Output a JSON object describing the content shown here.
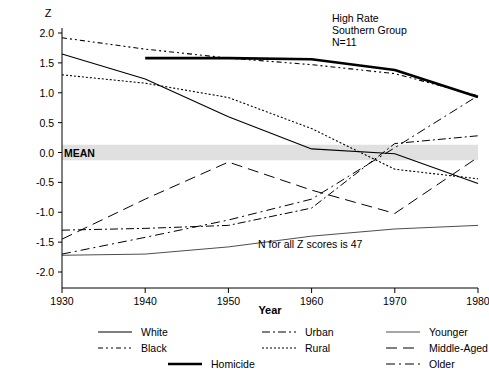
{
  "chart_data": {
    "type": "line",
    "title": "",
    "xlabel": "Year",
    "ylabel": "Z",
    "xlim": [
      1930,
      1980
    ],
    "ylim": [
      -2.0,
      2.0
    ],
    "grid": false,
    "legend_position": "bottom",
    "x": [
      1930,
      1940,
      1950,
      1960,
      1970,
      1980
    ],
    "xticklabels": [
      "1930",
      "1940",
      "1950",
      "1960",
      "1970",
      "1980"
    ],
    "yticklabels": [
      "2.0",
      "1.5",
      "1.0",
      "0.5",
      "0.0",
      "-0.5",
      "-1.0",
      "-1.5",
      "-2.0"
    ],
    "yticks": [
      2.0,
      1.5,
      1.0,
      0.5,
      0.0,
      -0.5,
      -1.0,
      -1.5,
      -2.0
    ],
    "reference_band": {
      "label": "MEAN",
      "value": 0.0,
      "half_width": 0.13,
      "color": "#e0e0e0"
    },
    "annotations": [
      {
        "text": "High  Rate",
        "x": 1963,
        "y": 1.95
      },
      {
        "text": "Southern Group",
        "x": 1963,
        "y": 1.82
      },
      {
        "text": "N=11",
        "x": 1963,
        "y": 1.69
      },
      {
        "text": "N for all Z scores is 47",
        "x": 1955,
        "y": -1.38
      }
    ],
    "series": [
      {
        "name": "White",
        "style": "solid-medium",
        "x": [
          1930,
          1940,
          1950,
          1960,
          1970,
          1980
        ],
        "values": [
          1.65,
          1.23,
          0.6,
          0.06,
          -0.02,
          -0.52
        ]
      },
      {
        "name": "Black",
        "style": "dash-dot-dot",
        "x": [
          1930,
          1940,
          1950,
          1960,
          1970,
          1980
        ],
        "values": [
          1.92,
          1.73,
          1.58,
          1.47,
          1.32,
          0.95
        ]
      },
      {
        "name": "Urban",
        "style": "dash-dot",
        "x": [
          1930,
          1940,
          1950,
          1960,
          1970,
          1980
        ],
        "values": [
          -1.3,
          -1.27,
          -1.22,
          -0.93,
          0.15,
          0.28
        ]
      },
      {
        "name": "Rural",
        "style": "dotted",
        "x": [
          1930,
          1940,
          1950,
          1960,
          1970,
          1980
        ],
        "values": [
          1.3,
          1.16,
          0.92,
          0.4,
          -0.28,
          -0.44
        ]
      },
      {
        "name": "Homicide",
        "style": "solid-thick",
        "x": [
          1940,
          1950,
          1960,
          1970,
          1980
        ],
        "values": [
          1.58,
          1.58,
          1.56,
          1.38,
          0.93
        ]
      },
      {
        "name": "Younger",
        "style": "solid-thin",
        "x": [
          1930,
          1940,
          1950,
          1960,
          1970,
          1980
        ],
        "values": [
          -1.72,
          -1.7,
          -1.58,
          -1.4,
          -1.28,
          -1.22
        ]
      },
      {
        "name": "Middle-Aged",
        "style": "long-dash",
        "x": [
          1930,
          1940,
          1950,
          1960,
          1970,
          1980
        ],
        "values": [
          -1.45,
          -0.78,
          -0.16,
          -0.63,
          -1.02,
          -0.08
        ]
      },
      {
        "name": "Older",
        "style": "dash-dot-long",
        "x": [
          1930,
          1940,
          1950,
          1960,
          1970,
          1980
        ],
        "values": [
          -1.7,
          -1.42,
          -1.13,
          -0.78,
          0.08,
          0.95
        ]
      }
    ]
  },
  "legend": {
    "columns": [
      [
        {
          "label": "White",
          "style": "solid-medium"
        },
        {
          "label": "Black",
          "style": "dash-dot-dot"
        }
      ],
      [
        {
          "label": "Urban",
          "style": "dash-dot"
        },
        {
          "label": "Rural",
          "style": "dotted"
        }
      ],
      [
        {
          "label": "Younger",
          "style": "solid-thin"
        },
        {
          "label": "Middle-Aged",
          "style": "long-dash"
        },
        {
          "label": "Older",
          "style": "dash-dot-long"
        }
      ]
    ],
    "center_entry": {
      "label": "Homicide",
      "style": "solid-thick"
    }
  }
}
